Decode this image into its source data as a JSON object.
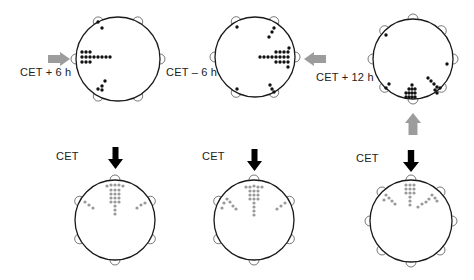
{
  "colors": {
    "outline": "#1a1a1a",
    "dot_black": "#111111",
    "dot_gray": "#9a9a9a",
    "arrow_gray": "#9c9c9c",
    "arrow_black": "#000000"
  },
  "panels": [
    {
      "id": "cet-plus-6h",
      "label": "CET + 6 h",
      "label_pos": [
        20,
        66
      ],
      "cx": 118,
      "cy": 59,
      "r": 42,
      "dot_color": "black",
      "bump_angles": [
        -62,
        -118,
        180,
        0,
        62,
        118
      ],
      "dots": [
        [
          98,
          22
        ],
        [
          102,
          28
        ],
        [
          82,
          52
        ],
        [
          86,
          52
        ],
        [
          90,
          52
        ],
        [
          82,
          57
        ],
        [
          86,
          57
        ],
        [
          90,
          57
        ],
        [
          94,
          57
        ],
        [
          98,
          57
        ],
        [
          102,
          57
        ],
        [
          106,
          57
        ],
        [
          110,
          57
        ],
        [
          82,
          62
        ],
        [
          86,
          62
        ],
        [
          90,
          62
        ],
        [
          105,
          81
        ],
        [
          102,
          86
        ],
        [
          98,
          89
        ],
        [
          102,
          90
        ]
      ],
      "arrow": {
        "type": "right",
        "color": "gray",
        "x": 48,
        "y": 52,
        "w": 22,
        "h": 14
      }
    },
    {
      "id": "cet-minus-6h",
      "label": "CET – 6 h",
      "label_pos": [
        166,
        66
      ],
      "cx": 255,
      "cy": 57,
      "r": 40,
      "dot_color": "black",
      "bump_angles": [
        -62,
        -118,
        180,
        0,
        62,
        118
      ],
      "dots": [
        [
          237,
          27
        ],
        [
          274,
          28
        ],
        [
          272,
          32
        ],
        [
          269,
          37
        ],
        [
          289,
          48
        ],
        [
          276,
          52
        ],
        [
          280,
          52
        ],
        [
          284,
          52
        ],
        [
          288,
          52
        ],
        [
          260,
          57
        ],
        [
          264,
          57
        ],
        [
          268,
          57
        ],
        [
          272,
          57
        ],
        [
          276,
          57
        ],
        [
          280,
          57
        ],
        [
          284,
          57
        ],
        [
          288,
          57
        ],
        [
          276,
          62
        ],
        [
          280,
          62
        ],
        [
          284,
          62
        ],
        [
          288,
          62
        ],
        [
          288,
          67
        ],
        [
          237,
          89
        ],
        [
          270,
          85
        ],
        [
          272,
          89
        ],
        [
          274,
          92
        ]
      ],
      "arrow": {
        "type": "left",
        "color": "gray",
        "x": 304,
        "y": 52,
        "w": 22,
        "h": 14
      }
    },
    {
      "id": "cet-plus-12h",
      "label": "CET + 12 h",
      "label_pos": [
        316,
        71
      ],
      "cx": 413,
      "cy": 59,
      "r": 40,
      "dot_color": "black",
      "bump_angles": [
        -90,
        -45,
        -135,
        180,
        0,
        45,
        135,
        90
      ],
      "dots": [
        [
          386,
          35
        ],
        [
          447,
          64
        ],
        [
          389,
          84
        ],
        [
          386,
          88
        ],
        [
          428,
          78
        ],
        [
          431,
          81
        ],
        [
          434,
          84
        ],
        [
          437,
          87
        ],
        [
          440,
          88
        ],
        [
          435,
          90
        ],
        [
          437,
          93
        ],
        [
          412,
          85
        ],
        [
          409,
          89
        ],
        [
          412,
          89
        ],
        [
          415,
          89
        ],
        [
          406,
          93
        ],
        [
          409,
          93
        ],
        [
          412,
          93
        ],
        [
          415,
          93
        ],
        [
          406,
          97
        ],
        [
          409,
          97
        ],
        [
          412,
          97
        ],
        [
          415,
          97
        ]
      ],
      "arrow": {
        "type": "up",
        "color": "gray",
        "x": 405,
        "y": 113,
        "w": 16,
        "h": 22
      }
    },
    {
      "id": "cet-left",
      "label": "CET",
      "label_pos": [
        56,
        150
      ],
      "cx": 115,
      "cy": 220,
      "r": 40,
      "dot_color": "gray",
      "bump_angles": [
        -90,
        -28,
        -152,
        28,
        152,
        90
      ],
      "dots": [
        [
          107,
          186
        ],
        [
          111,
          185
        ],
        [
          115,
          185
        ],
        [
          119,
          185
        ],
        [
          123,
          186
        ],
        [
          111,
          190
        ],
        [
          115,
          190
        ],
        [
          119,
          190
        ],
        [
          111,
          194
        ],
        [
          115,
          194
        ],
        [
          119,
          194
        ],
        [
          111,
          198
        ],
        [
          115,
          198
        ],
        [
          119,
          198
        ],
        [
          111,
          202
        ],
        [
          115,
          202
        ],
        [
          119,
          202
        ],
        [
          115,
          206
        ],
        [
          115,
          210
        ],
        [
          115,
          214
        ],
        [
          85,
          202
        ],
        [
          89,
          205
        ],
        [
          93,
          208
        ],
        [
          137,
          208
        ],
        [
          141,
          205
        ],
        [
          145,
          203
        ]
      ],
      "arrow": {
        "type": "down",
        "color": "black",
        "x": 108,
        "y": 147,
        "w": 15,
        "h": 22
      }
    },
    {
      "id": "cet-middle",
      "label": "CET",
      "label_pos": [
        202,
        150
      ],
      "cx": 254,
      "cy": 220,
      "r": 40,
      "dot_color": "gray",
      "bump_angles": [
        -90,
        -28,
        -152,
        28,
        152,
        90
      ],
      "dots": [
        [
          246,
          187
        ],
        [
          250,
          187
        ],
        [
          254,
          186
        ],
        [
          258,
          187
        ],
        [
          262,
          187
        ],
        [
          250,
          191
        ],
        [
          254,
          191
        ],
        [
          258,
          191
        ],
        [
          250,
          195
        ],
        [
          254,
          195
        ],
        [
          258,
          195
        ],
        [
          250,
          199
        ],
        [
          254,
          199
        ],
        [
          258,
          199
        ],
        [
          254,
          203
        ],
        [
          254,
          207
        ],
        [
          254,
          211
        ],
        [
          254,
          215
        ],
        [
          227,
          199
        ],
        [
          224,
          203
        ],
        [
          230,
          202
        ],
        [
          233,
          206
        ],
        [
          236,
          209
        ],
        [
          222,
          208
        ],
        [
          277,
          209
        ],
        [
          281,
          206
        ],
        [
          285,
          203
        ]
      ],
      "arrow": {
        "type": "down",
        "color": "black",
        "x": 247,
        "y": 149,
        "w": 15,
        "h": 22
      }
    },
    {
      "id": "cet-right",
      "label": "CET",
      "label_pos": [
        356,
        152
      ],
      "cx": 411,
      "cy": 221,
      "r": 41,
      "dot_color": "gray",
      "bump_angles": [
        -90,
        -45,
        -135,
        180,
        0,
        45,
        135,
        90
      ],
      "dots": [
        [
          406,
          185
        ],
        [
          410,
          185
        ],
        [
          414,
          185
        ],
        [
          406,
          189
        ],
        [
          410,
          189
        ],
        [
          414,
          189
        ],
        [
          406,
          193
        ],
        [
          410,
          193
        ],
        [
          414,
          193
        ],
        [
          410,
          197
        ],
        [
          410,
          201
        ],
        [
          410,
          205
        ],
        [
          386,
          195
        ],
        [
          389,
          198
        ],
        [
          392,
          201
        ],
        [
          395,
          204
        ],
        [
          384,
          200
        ],
        [
          432,
          195
        ],
        [
          435,
          198
        ],
        [
          429,
          199
        ],
        [
          426,
          202
        ],
        [
          422,
          204
        ],
        [
          418,
          207
        ],
        [
          437,
          201
        ]
      ],
      "arrow": {
        "type": "down",
        "color": "black",
        "x": 403,
        "y": 150,
        "w": 16,
        "h": 22
      }
    }
  ]
}
